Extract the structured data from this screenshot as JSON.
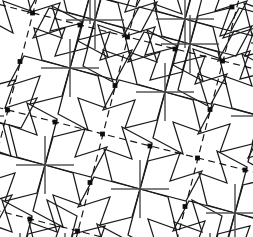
{
  "figure": {
    "type": "geometric-tiling-diagram",
    "width": 253,
    "height": 237,
    "background_color": "#ffffff"
  },
  "colors": {
    "solid_line": "#1a1a1a",
    "cross_arm_line": "#4a4a4a",
    "lattice_dash_line": "#111111",
    "lattice_dot": "#0d0d0d",
    "background": "#ffffff"
  },
  "lattice": {
    "name": "dashed-unit-cell-lattice",
    "dash_pattern": "7 4.5",
    "origin": [
      33,
      13
    ],
    "vector_a": [
      95,
      24
    ],
    "vector_b": [
      -25,
      97
    ],
    "a_indices": [
      -1,
      0,
      1,
      2,
      3
    ],
    "b_indices": [
      -1,
      0,
      1,
      2,
      3
    ],
    "dot_radius": 2.4,
    "dot_points": [
      [
        32.5,
        13
      ],
      [
        127.5,
        37
      ],
      [
        222.5,
        61
      ],
      [
        7.5,
        110
      ],
      [
        102.5,
        134
      ],
      [
        197.5,
        158
      ],
      [
        -17.5,
        207
      ],
      [
        77.5,
        231
      ],
      [
        172.5,
        255
      ]
    ],
    "midpoint_dots": [
      [
        80,
        25
      ],
      [
        175,
        49
      ],
      [
        20,
        61.5
      ],
      [
        115,
        85.5
      ],
      [
        210,
        109.5
      ],
      [
        55,
        122
      ],
      [
        150,
        146
      ],
      [
        245,
        170
      ],
      [
        -10,
        158.5
      ],
      [
        90,
        182.5
      ],
      [
        185,
        206.5
      ],
      [
        30,
        219
      ],
      [
        232,
        7
      ]
    ]
  },
  "motif": {
    "name": "pinwheel-zigzag-unit",
    "cross_arm_length": 29,
    "centers": [
      [
        70,
        68
      ],
      [
        165,
        92
      ],
      [
        260,
        116
      ],
      [
        45,
        165
      ],
      [
        140,
        189
      ],
      [
        235,
        213
      ],
      [
        95,
        20
      ],
      [
        190,
        44
      ],
      [
        -25,
        116
      ],
      [
        20,
        262
      ],
      [
        115,
        286
      ],
      [
        -50,
        213
      ],
      [
        285,
        20
      ],
      [
        -5,
        -29
      ],
      [
        90,
        -5
      ],
      [
        185,
        19
      ],
      [
        280,
        43
      ],
      [
        65,
        262
      ],
      [
        210,
        262
      ],
      [
        310,
        140
      ]
    ],
    "arm_count": 4,
    "rotation_deg": 0,
    "zigzag_arm_spec": {
      "description": "each motif emits four rotationally symmetric zigzag blades at 90-degree steps",
      "points": [
        [
          0,
          0
        ],
        [
          -28,
          -8
        ],
        [
          -36,
          -40
        ],
        [
          -8,
          -30
        ],
        [
          -18,
          -62
        ],
        [
          12,
          -46
        ],
        [
          0,
          0
        ]
      ]
    }
  },
  "annotations": {
    "has_axes": false,
    "has_labels": false,
    "has_legend": false,
    "visible_text": []
  }
}
